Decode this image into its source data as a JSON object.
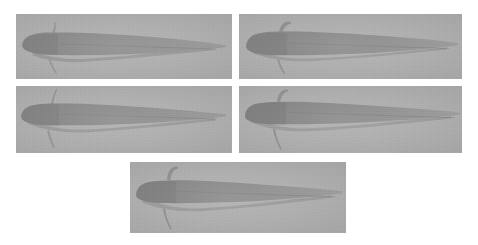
{
  "figure": {
    "caption": "",
    "background_color": "#ffffff",
    "layout": "2-2-1 grid of grayscale specimen radiographs",
    "panel_count": 5,
    "colors": {
      "panel_background": "#b2b2b2",
      "specimen_body": "#8d8d8d",
      "specimen_body_dark": "#848484",
      "specimen_tail_light": "#9d9d9d",
      "page_background": "#ffffff"
    },
    "panels": [
      {
        "id": "panel-1",
        "label": "",
        "position": "row-1-left",
        "x": 16,
        "y": 14,
        "width": 216,
        "height": 65,
        "specimen": {
          "name": "larval-specimen",
          "orientation": "head-left",
          "head_x_pct": 3,
          "body_end_x_pct": 55,
          "tail_tip_x_pct": 97,
          "midline_y_pct": 50,
          "head_height_pct": 52,
          "has_dorsal_filament": true,
          "has_ventral_fin": true
        }
      },
      {
        "id": "panel-2",
        "label": "",
        "position": "row-1-right",
        "x": 239,
        "y": 14,
        "width": 223,
        "height": 65,
        "specimen": {
          "name": "larval-specimen",
          "orientation": "head-left",
          "head_x_pct": 3,
          "body_end_x_pct": 60,
          "tail_tip_x_pct": 98,
          "midline_y_pct": 48,
          "head_height_pct": 56,
          "has_dorsal_filament": true,
          "has_ventral_fin": true
        }
      },
      {
        "id": "panel-3",
        "label": "",
        "position": "row-2-left",
        "x": 16,
        "y": 86,
        "width": 216,
        "height": 67,
        "specimen": {
          "name": "larval-specimen",
          "orientation": "head-left",
          "head_x_pct": 2,
          "body_end_x_pct": 58,
          "tail_tip_x_pct": 97,
          "midline_y_pct": 46,
          "head_height_pct": 50,
          "has_dorsal_filament": true,
          "has_ventral_fin": true
        }
      },
      {
        "id": "panel-4",
        "label": "",
        "position": "row-2-right",
        "x": 239,
        "y": 86,
        "width": 223,
        "height": 67,
        "specimen": {
          "name": "larval-specimen",
          "orientation": "head-left",
          "head_x_pct": 3,
          "body_end_x_pct": 57,
          "tail_tip_x_pct": 98,
          "midline_y_pct": 44,
          "head_height_pct": 54,
          "has_dorsal_filament": true,
          "has_ventral_fin": true
        }
      },
      {
        "id": "panel-5",
        "label": "",
        "position": "row-3-center",
        "x": 130,
        "y": 162,
        "width": 216,
        "height": 71,
        "specimen": {
          "name": "larval-specimen",
          "orientation": "head-left",
          "head_x_pct": 3,
          "body_end_x_pct": 58,
          "tail_tip_x_pct": 96,
          "midline_y_pct": 45,
          "head_height_pct": 52,
          "has_dorsal_filament": true,
          "has_ventral_fin": true
        }
      }
    ]
  }
}
